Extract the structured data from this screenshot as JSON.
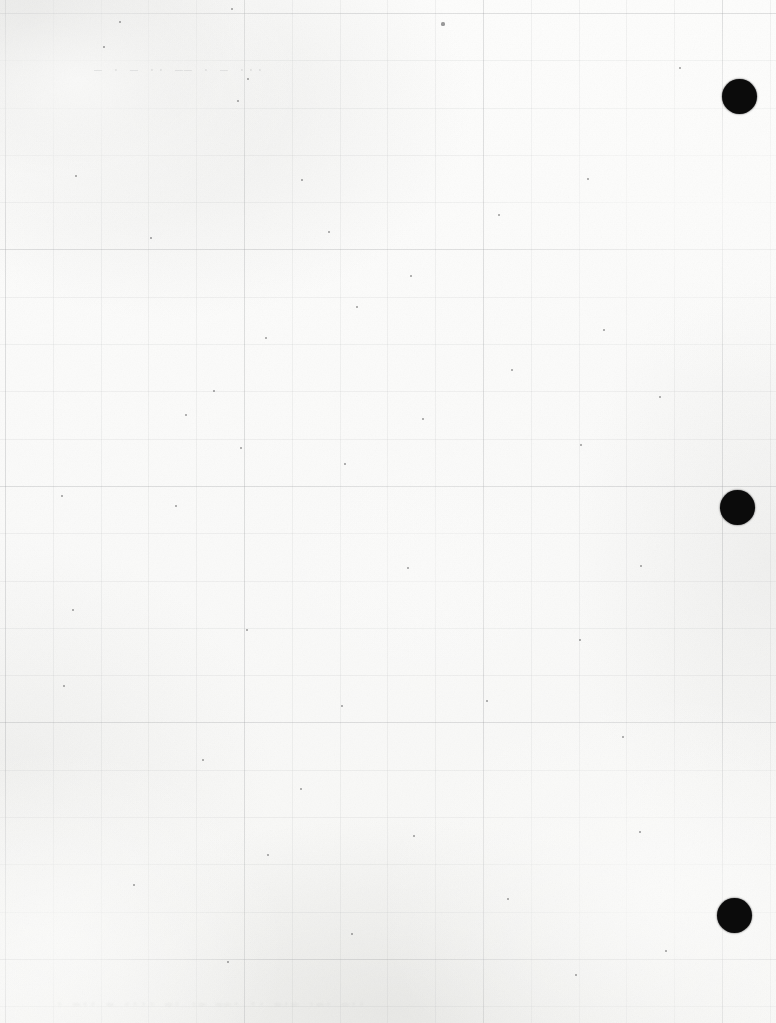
{
  "page": {
    "width": 776,
    "height": 1023,
    "background_color": "#fbfbfa",
    "ink_color": "#0b0b0b"
  },
  "punch_marks": {
    "label": "punch-registration-dot",
    "color": "#0b0b0b",
    "diameter": 35,
    "count": 3,
    "dots": [
      {
        "name": "punch-dot-top",
        "cx": 739,
        "cy": 96,
        "d": 35
      },
      {
        "name": "punch-dot-middle",
        "cx": 737,
        "cy": 507,
        "d": 35
      },
      {
        "name": "punch-dot-bottom",
        "cx": 734,
        "cy": 915,
        "d": 35
      }
    ]
  },
  "ghost_text": {
    "header": "— · — ·· —— · — ···",
    "footer": "· —·· — ···· —· ·— ——· ·· —·— ·—· —··"
  },
  "grid": {
    "visible": true,
    "kind": "reverse-side-showthrough",
    "minor_pitch_x": 47.8,
    "minor_pitch_y": 47.3,
    "major_pitch_x": 239,
    "major_pitch_y": 236.5,
    "color": "#a8aaac"
  },
  "specks": [
    {
      "x": 120,
      "y": 22,
      "r": 1.0
    },
    {
      "x": 232,
      "y": 9,
      "r": 1.3
    },
    {
      "x": 443,
      "y": 24,
      "r": 1.6
    },
    {
      "x": 104,
      "y": 47,
      "r": 0.9
    },
    {
      "x": 680,
      "y": 68,
      "r": 1.1
    },
    {
      "x": 248,
      "y": 79,
      "r": 1.0
    },
    {
      "x": 238,
      "y": 101,
      "r": 1.2
    },
    {
      "x": 76,
      "y": 176,
      "r": 1.3
    },
    {
      "x": 302,
      "y": 180,
      "r": 0.9
    },
    {
      "x": 329,
      "y": 232,
      "r": 1.0
    },
    {
      "x": 588,
      "y": 179,
      "r": 1.1
    },
    {
      "x": 499,
      "y": 215,
      "r": 1.0
    },
    {
      "x": 151,
      "y": 238,
      "r": 0.9
    },
    {
      "x": 411,
      "y": 276,
      "r": 1.1
    },
    {
      "x": 357,
      "y": 307,
      "r": 1.0
    },
    {
      "x": 266,
      "y": 338,
      "r": 1.2
    },
    {
      "x": 604,
      "y": 330,
      "r": 1.0
    },
    {
      "x": 186,
      "y": 415,
      "r": 1.4
    },
    {
      "x": 214,
      "y": 391,
      "r": 0.9
    },
    {
      "x": 512,
      "y": 370,
      "r": 1.1
    },
    {
      "x": 423,
      "y": 419,
      "r": 1.3
    },
    {
      "x": 660,
      "y": 397,
      "r": 1.0
    },
    {
      "x": 241,
      "y": 448,
      "r": 1.0
    },
    {
      "x": 345,
      "y": 464,
      "r": 0.9
    },
    {
      "x": 581,
      "y": 445,
      "r": 1.1
    },
    {
      "x": 62,
      "y": 496,
      "r": 1.0
    },
    {
      "x": 176,
      "y": 506,
      "r": 1.1
    },
    {
      "x": 408,
      "y": 568,
      "r": 1.0
    },
    {
      "x": 641,
      "y": 566,
      "r": 1.2
    },
    {
      "x": 73,
      "y": 610,
      "r": 1.0
    },
    {
      "x": 247,
      "y": 630,
      "r": 1.1
    },
    {
      "x": 580,
      "y": 640,
      "r": 0.9
    },
    {
      "x": 64,
      "y": 686,
      "r": 1.3
    },
    {
      "x": 342,
      "y": 706,
      "r": 1.0
    },
    {
      "x": 487,
      "y": 701,
      "r": 1.1
    },
    {
      "x": 623,
      "y": 737,
      "r": 1.0
    },
    {
      "x": 203,
      "y": 760,
      "r": 1.0
    },
    {
      "x": 301,
      "y": 789,
      "r": 1.2
    },
    {
      "x": 414,
      "y": 836,
      "r": 1.0
    },
    {
      "x": 268,
      "y": 855,
      "r": 1.1
    },
    {
      "x": 640,
      "y": 832,
      "r": 0.9
    },
    {
      "x": 134,
      "y": 885,
      "r": 1.0
    },
    {
      "x": 508,
      "y": 899,
      "r": 1.1
    },
    {
      "x": 352,
      "y": 934,
      "r": 1.0
    },
    {
      "x": 228,
      "y": 962,
      "r": 0.9
    },
    {
      "x": 576,
      "y": 975,
      "r": 1.1
    },
    {
      "x": 666,
      "y": 951,
      "r": 1.0
    }
  ]
}
